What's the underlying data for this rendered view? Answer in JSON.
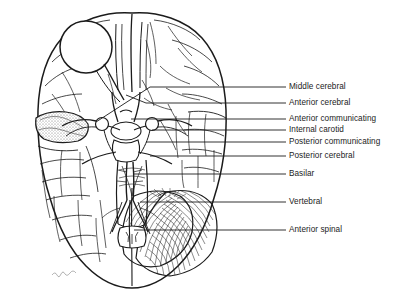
{
  "figure": {
    "view": "inferior (ventral) view of human brain",
    "background_color": "#ffffff",
    "ink_color": "#1b1b1b",
    "artist_signature": "signature mark at lower-left of brain outline"
  },
  "structures": [
    {
      "name": "olfactory-bulb",
      "note": "circular structure on left frontal lobe"
    },
    {
      "name": "frontal-lobe"
    },
    {
      "name": "temporal-lobe"
    },
    {
      "name": "insula-stippled-region"
    },
    {
      "name": "occipital-lobe"
    },
    {
      "name": "cerebellum",
      "note": "striated folia, lower right"
    },
    {
      "name": "brainstem"
    },
    {
      "name": "spinal-cord",
      "note": "cross-section at bottom center"
    },
    {
      "name": "circle-of-willis",
      "note": "central arterial polygon"
    }
  ],
  "labels": [
    {
      "id": "middle-cerebral",
      "text": "Middle cerebral",
      "y": 87,
      "leader_x1": 262,
      "leader_x2": 286
    },
    {
      "id": "anterior-cerebral",
      "text": "Anterior cerebral",
      "y": 103,
      "leader_x1": 262,
      "leader_x2": 286
    },
    {
      "id": "anterior-communicating",
      "text": "Anterior communicating",
      "y": 119,
      "leader_x1": 262,
      "leader_x2": 286
    },
    {
      "id": "internal-carotid",
      "text": "Internal carotid",
      "y": 130,
      "leader_x1": 262,
      "leader_x2": 286
    },
    {
      "id": "posterior-communicating",
      "text": "Posterior communicating",
      "y": 142,
      "leader_x1": 262,
      "leader_x2": 286
    },
    {
      "id": "posterior-cerebral",
      "text": "Posterior cerebral",
      "y": 156,
      "leader_x1": 262,
      "leader_x2": 286
    },
    {
      "id": "basilar",
      "text": "Basilar",
      "y": 174,
      "leader_x1": 262,
      "leader_x2": 286
    },
    {
      "id": "vertebral",
      "text": "Vertebral",
      "y": 202,
      "leader_x1": 262,
      "leader_x2": 286
    },
    {
      "id": "anterior-spinal",
      "text": "Anterior spinal",
      "y": 230,
      "leader_x1": 262,
      "leader_x2": 286
    }
  ]
}
